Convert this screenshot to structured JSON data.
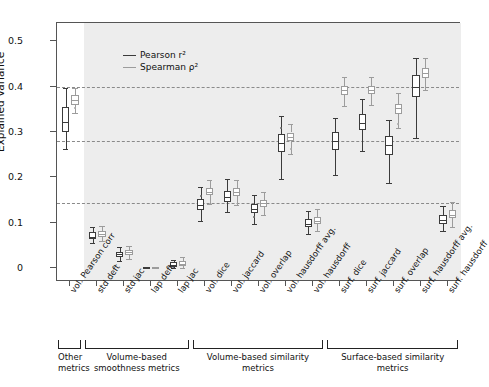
{
  "chart_data": {
    "type": "box",
    "title": "",
    "xlabel": "",
    "ylabel": "Explained Variance",
    "ylim": [
      -0.03,
      0.54
    ],
    "yticks": [
      0,
      0.1,
      0.2,
      0.3,
      0.4,
      0.5
    ],
    "ytick_labels": [
      "0",
      "0.1",
      "0.2",
      "0.3",
      "0.4",
      "0.5"
    ],
    "grid": "horizontal-dashed",
    "gridlines": [
      0.4,
      0.28,
      0.143
    ],
    "legend_position": "upper-left",
    "series": [
      {
        "name": "Pearson r²",
        "color": "#3b3b3b"
      },
      {
        "name": "Spearman ρ²",
        "color": "#9c9c9c"
      }
    ],
    "categories": [
      "vol. Pearson corr",
      "std deft",
      "std jac",
      "lap deft",
      "lap jac",
      "vol. dice",
      "vol. jaccard",
      "vol. overlap",
      "vol. hausdorff avg.",
      "vol. hausdorff",
      "surf. dice",
      "surf. jaccard",
      "surf. overlap",
      "surf. hausdorff avg.",
      "surf. hausdorff"
    ],
    "groups": [
      {
        "label": "Other metrics",
        "from": 0,
        "to": 0,
        "shaded": false
      },
      {
        "label": "Volume-based smoothness metrics",
        "from": 1,
        "to": 4,
        "shaded": true
      },
      {
        "label": "Volume-based similarity metrics",
        "from": 5,
        "to": 9,
        "shaded": true
      },
      {
        "label": "Surface-based similarity metrics",
        "from": 10,
        "to": 14,
        "shaded": true
      }
    ],
    "boxes": {
      "pearson": [
        {
          "cat": "vol. Pearson corr",
          "low": 0.262,
          "q1": 0.3,
          "med": 0.323,
          "q3": 0.356,
          "high": 0.397,
          "outliers": []
        },
        {
          "cat": "std deft",
          "low": 0.055,
          "q1": 0.064,
          "med": 0.07,
          "q3": 0.079,
          "high": 0.09,
          "outliers": []
        },
        {
          "cat": "std jac",
          "low": 0.017,
          "q1": 0.026,
          "med": 0.031,
          "q3": 0.037,
          "high": 0.046,
          "outliers": []
        },
        {
          "cat": "lap deft",
          "low": 0.0,
          "q1": 0.0,
          "med": 0.001,
          "q3": 0.002,
          "high": 0.003,
          "outliers": []
        },
        {
          "cat": "lap jac",
          "low": 0.0,
          "q1": 0.004,
          "med": 0.008,
          "q3": 0.013,
          "high": 0.019,
          "outliers": []
        },
        {
          "cat": "vol. dice",
          "low": 0.104,
          "q1": 0.129,
          "med": 0.139,
          "q3": 0.152,
          "high": 0.178,
          "outliers": [
            0.16
          ]
        },
        {
          "cat": "vol. jaccard",
          "low": 0.124,
          "q1": 0.147,
          "med": 0.158,
          "q3": 0.171,
          "high": 0.196,
          "outliers": []
        },
        {
          "cat": "vol. overlap",
          "low": 0.098,
          "q1": 0.121,
          "med": 0.131,
          "q3": 0.141,
          "high": 0.161,
          "outliers": [
            0.114
          ]
        },
        {
          "cat": "vol. hausdorff avg.",
          "low": 0.196,
          "q1": 0.256,
          "med": 0.276,
          "q3": 0.295,
          "high": 0.336,
          "outliers": [
            0.308
          ]
        },
        {
          "cat": "vol. hausdorff",
          "low": 0.075,
          "q1": 0.09,
          "med": 0.098,
          "q3": 0.108,
          "high": 0.126,
          "outliers": []
        },
        {
          "cat": "surf. dice",
          "low": 0.205,
          "q1": 0.26,
          "med": 0.281,
          "q3": 0.3,
          "high": 0.331,
          "outliers": []
        },
        {
          "cat": "surf. jaccard",
          "low": 0.258,
          "q1": 0.304,
          "med": 0.32,
          "q3": 0.34,
          "high": 0.372,
          "outliers": []
        },
        {
          "cat": "surf. overlap",
          "low": 0.188,
          "q1": 0.25,
          "med": 0.272,
          "q3": 0.291,
          "high": 0.327,
          "outliers": []
        },
        {
          "cat": "surf. hausdorff avg.",
          "low": 0.288,
          "q1": 0.377,
          "med": 0.4,
          "q3": 0.425,
          "high": 0.464,
          "outliers": []
        },
        {
          "cat": "surf. hausdorff",
          "low": 0.082,
          "q1": 0.098,
          "med": 0.107,
          "q3": 0.118,
          "high": 0.138,
          "outliers": []
        }
      ],
      "spearman": [
        {
          "cat": "vol. Pearson corr",
          "low": 0.342,
          "q1": 0.36,
          "med": 0.37,
          "q3": 0.382,
          "high": 0.398,
          "outliers": [
            0.352
          ]
        },
        {
          "cat": "std deft",
          "low": 0.06,
          "q1": 0.07,
          "med": 0.076,
          "q3": 0.083,
          "high": 0.094,
          "outliers": []
        },
        {
          "cat": "std jac",
          "low": 0.02,
          "q1": 0.029,
          "med": 0.035,
          "q3": 0.041,
          "high": 0.05,
          "outliers": []
        },
        {
          "cat": "lap deft",
          "low": 0.0,
          "q1": 0.001,
          "med": 0.001,
          "q3": 0.002,
          "high": 0.004,
          "outliers": []
        },
        {
          "cat": "lap jac",
          "low": 0.0,
          "q1": 0.005,
          "med": 0.01,
          "q3": 0.016,
          "high": 0.024,
          "outliers": []
        },
        {
          "cat": "vol. dice",
          "low": 0.141,
          "q1": 0.161,
          "med": 0.168,
          "q3": 0.176,
          "high": 0.194,
          "outliers": []
        },
        {
          "cat": "vol. jaccard",
          "low": 0.14,
          "q1": 0.16,
          "med": 0.168,
          "q3": 0.176,
          "high": 0.194,
          "outliers": []
        },
        {
          "cat": "vol. overlap",
          "low": 0.118,
          "q1": 0.136,
          "med": 0.143,
          "q3": 0.151,
          "high": 0.168,
          "outliers": []
        },
        {
          "cat": "vol. hausdorff avg.",
          "low": 0.252,
          "q1": 0.28,
          "med": 0.289,
          "q3": 0.299,
          "high": 0.318,
          "outliers": [
            0.262
          ]
        },
        {
          "cat": "vol. hausdorff",
          "low": 0.082,
          "q1": 0.098,
          "med": 0.105,
          "q3": 0.114,
          "high": 0.131,
          "outliers": []
        },
        {
          "cat": "surf. dice",
          "low": 0.358,
          "q1": 0.382,
          "med": 0.392,
          "q3": 0.401,
          "high": 0.421,
          "outliers": []
        },
        {
          "cat": "surf. jaccard",
          "low": 0.36,
          "q1": 0.384,
          "med": 0.393,
          "q3": 0.402,
          "high": 0.422,
          "outliers": []
        },
        {
          "cat": "surf. overlap",
          "low": 0.31,
          "q1": 0.34,
          "med": 0.352,
          "q3": 0.362,
          "high": 0.385,
          "outliers": [
            0.318
          ]
        },
        {
          "cat": "surf. hausdorff avg.",
          "low": 0.392,
          "q1": 0.42,
          "med": 0.43,
          "q3": 0.44,
          "high": 0.462,
          "outliers": []
        },
        {
          "cat": "surf. hausdorff",
          "low": 0.092,
          "q1": 0.11,
          "med": 0.118,
          "q3": 0.128,
          "high": 0.146,
          "outliers": []
        }
      ]
    }
  }
}
